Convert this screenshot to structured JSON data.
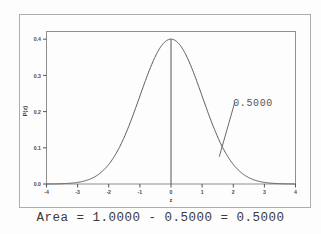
{
  "chart_data": {
    "type": "line",
    "title": "",
    "subtitle": "",
    "xlabel": "z",
    "ylabel": "P(z)",
    "xlim": [
      -4,
      4
    ],
    "ylim": [
      0.0,
      0.42
    ],
    "grid": false,
    "legend": "none",
    "curve_name": "standard-normal-pdf",
    "curve_formula": "P(z) = (1/sqrt(2*pi)) * exp(-z^2/2)",
    "xticks": [
      "-4",
      "-3",
      "-2",
      "-1",
      "0",
      "1",
      "2",
      "3",
      "4"
    ],
    "xtick_values": [
      -4,
      -3,
      -2,
      -1,
      0,
      1,
      2,
      3,
      4
    ],
    "yticks": [
      "0.0",
      "0.1",
      "0.2",
      "0.3",
      "0.4"
    ],
    "ytick_values": [
      0.0,
      0.1,
      0.2,
      0.3,
      0.4
    ],
    "series": [
      {
        "name": "standard normal density",
        "x": [
          -4.0,
          -3.75,
          -3.5,
          -3.25,
          -3.0,
          -2.75,
          -2.5,
          -2.25,
          -2.0,
          -1.75,
          -1.5,
          -1.25,
          -1.0,
          -0.75,
          -0.5,
          -0.25,
          0.0,
          0.25,
          0.5,
          0.75,
          1.0,
          1.25,
          1.5,
          1.75,
          2.0,
          2.25,
          2.5,
          2.75,
          3.0,
          3.25,
          3.5,
          3.75,
          4.0
        ],
        "values": [
          0.0001,
          0.0004,
          0.0009,
          0.002,
          0.0044,
          0.0091,
          0.0175,
          0.0317,
          0.054,
          0.0863,
          0.1295,
          0.1826,
          0.242,
          0.3011,
          0.3521,
          0.3867,
          0.3989,
          0.3867,
          0.3521,
          0.3011,
          0.242,
          0.1826,
          0.1295,
          0.0863,
          0.054,
          0.0317,
          0.0175,
          0.0091,
          0.0044,
          0.002,
          0.0009,
          0.0004,
          0.0001
        ]
      }
    ],
    "annotations": [
      {
        "name": "area-label",
        "text": "0.5000",
        "x": 2.0,
        "y": 0.215,
        "leader_line_from": [
          1.55,
          0.075
        ],
        "leader_line_to": [
          2.05,
          0.225
        ]
      },
      {
        "name": "center-vertical-line",
        "text": "",
        "x": 0,
        "y_from": 0.0,
        "y_to": 0.3989
      }
    ]
  },
  "caption": {
    "text": "Area = 1.0000 - 0.5000 = 0.5000",
    "area_total": "1.0000",
    "area_subtracted": "0.5000",
    "area_result": "0.5000"
  },
  "colors": {
    "background": "#fdfdfd",
    "frame": "#adadad",
    "axis": "#555555",
    "curve": "#5a5a5a",
    "text": "#3a3a3a",
    "annotation": "#555555"
  }
}
